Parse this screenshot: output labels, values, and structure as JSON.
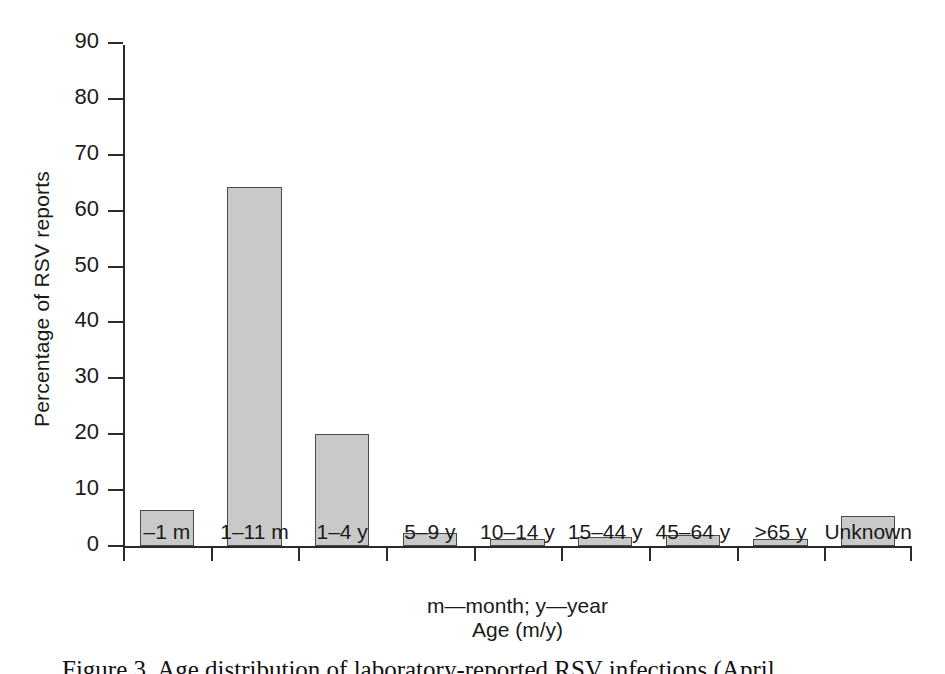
{
  "chart_data": {
    "type": "bar",
    "title": "",
    "subtitle": "",
    "xlabel": "Age (m/y)",
    "xnote": "m—month; y—year",
    "ylabel": "Percentage of RSV reports",
    "ylim": [
      0,
      90
    ],
    "ytick_step": 10,
    "yticks": [
      0,
      10,
      20,
      30,
      40,
      50,
      60,
      70,
      80,
      90
    ],
    "ytick_labels": [
      "0",
      "10",
      "20",
      "30",
      "40",
      "50",
      "60",
      "70",
      "80",
      "90"
    ],
    "grid": false,
    "legend": null,
    "categories": [
      "–1 m",
      "1–11 m",
      "1–4 y",
      "5–9 y",
      "10–14 y",
      "15–44 y",
      "45–64 y",
      ">65 y",
      "Unknown"
    ],
    "values": [
      6.5,
      64.2,
      20.0,
      2.3,
      1.3,
      1.7,
      2.0,
      1.3,
      5.3
    ],
    "bar_color": "#c9c9c9",
    "bar_edge_color": "#4a4a4a",
    "axis_color": "#2b2b2b",
    "background_color": "#ffffff"
  },
  "caption": {
    "text": "Figure 3. Age distribution of laboratory-reported RSV infections (April…"
  }
}
